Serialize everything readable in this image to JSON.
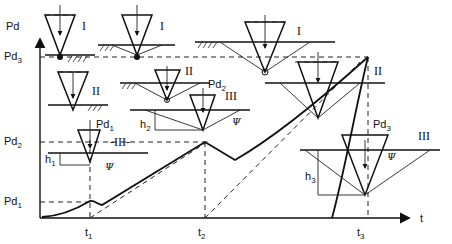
{
  "diagram": {
    "y_axis_label": "Pd",
    "x_axis_label": "t",
    "y_ticks": [
      {
        "main": "Pd",
        "sub": "3"
      },
      {
        "main": "Pd",
        "sub": "2"
      },
      {
        "main": "Pd",
        "sub": "1"
      }
    ],
    "x_ticks": [
      {
        "main": "t",
        "sub": "1"
      },
      {
        "main": "t",
        "sub": "2"
      },
      {
        "main": "t",
        "sub": "3"
      }
    ],
    "stage_labels": {
      "I": "I",
      "II": "II",
      "III": "III",
      "III_dashed": "-III-"
    },
    "inset_labels": {
      "pd1": {
        "main": "Pd",
        "sub": "1"
      },
      "pd2": {
        "main": "Pd",
        "sub": "2"
      },
      "pd3": {
        "main": "Pd",
        "sub": "3"
      },
      "h1": {
        "main": "h",
        "sub": "1"
      },
      "h2": {
        "main": "h",
        "sub": "2"
      },
      "h3": {
        "main": "h",
        "sub": "3"
      },
      "psi": "Ψ"
    }
  }
}
